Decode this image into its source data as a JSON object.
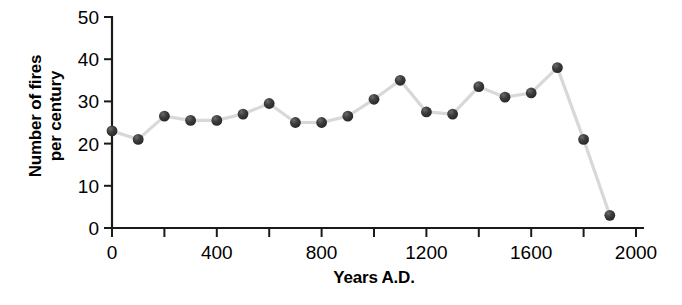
{
  "chart_data": {
    "type": "line",
    "title": "",
    "xlabel": "Years A.D.",
    "ylabel": "Number of fires per century",
    "ylabel_line1": "Number of fires",
    "ylabel_line2": "per century",
    "xlim": [
      0,
      2000
    ],
    "ylim": [
      0,
      50
    ],
    "grid": false,
    "legend": null,
    "xticks": [
      0,
      200,
      400,
      600,
      800,
      1000,
      1200,
      1400,
      1600,
      1800,
      2000
    ],
    "xtick_labels": [
      "0",
      "",
      "400",
      "",
      "800",
      "",
      "1200",
      "",
      "1600",
      "",
      "2000"
    ],
    "yticks": [
      0,
      10,
      20,
      30,
      40,
      50
    ],
    "ytick_labels": [
      "0",
      "10",
      "20",
      "30",
      "40",
      "50"
    ],
    "x": [
      0,
      100,
      200,
      300,
      400,
      500,
      600,
      700,
      800,
      900,
      1000,
      1100,
      1200,
      1300,
      1400,
      1500,
      1600,
      1700,
      1800,
      1900
    ],
    "values": [
      23,
      21,
      26.5,
      25.5,
      25.5,
      27,
      29.5,
      25,
      25,
      26.5,
      30.5,
      35,
      27.5,
      27,
      33.5,
      31,
      32,
      38,
      21,
      3
    ],
    "marker_color": "#3a3a3a",
    "line_color": "#d8d8d8",
    "axis_color": "#1a1a1a"
  }
}
